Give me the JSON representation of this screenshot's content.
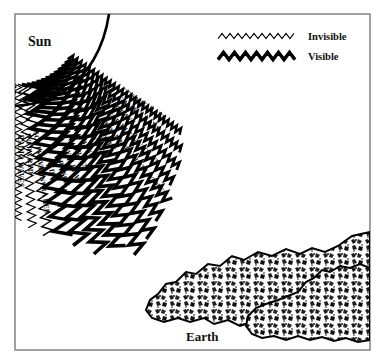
{
  "figure": {
    "sun_label": "Sun",
    "earth_label": "Earth",
    "background_color": "#ffffff",
    "ink_color": "#000000",
    "frame_color": "#8a8a8a"
  },
  "legend": {
    "items": [
      {
        "label": "Invisible",
        "style": "thin-zigzag",
        "stroke_width": 1.1
      },
      {
        "label": "Visible",
        "style": "thick-zigzag",
        "stroke_width": 3.4
      }
    ]
  },
  "chart_data": {
    "type": "diagram",
    "rays": [
      {
        "label": "COSMIC RAYS",
        "visibility": "Invisible",
        "order": 1,
        "angle_deg": 34,
        "amplitude": 3.0,
        "wavelength": 5.0,
        "stroke": 2.6
      },
      {
        "label": "GAMMA RAYS",
        "visibility": "Invisible",
        "order": 2,
        "angle_deg": 38,
        "amplitude": 3.4,
        "wavelength": 5.6,
        "stroke": 2.7
      },
      {
        "label": "X-RAYS",
        "visibility": "Invisible",
        "order": 3,
        "angle_deg": 42,
        "amplitude": 3.8,
        "wavelength": 6.2,
        "stroke": 2.8
      },
      {
        "label": "FAR ULTRAVIOLET",
        "visibility": "Invisible",
        "order": 4,
        "angle_deg": 46,
        "amplitude": 4.4,
        "wavelength": 7.0,
        "stroke": 3.0
      },
      {
        "label": "MID AND NEAR ULTRAVIOLET",
        "visibility": "Invisible",
        "order": 5,
        "angle_deg": 50,
        "amplitude": 5.0,
        "wavelength": 8.0,
        "stroke": 3.1
      },
      {
        "label": "VIOLET",
        "visibility": "Visible",
        "order": 6,
        "angle_deg": 54,
        "amplitude": 5.6,
        "wavelength": 9.0,
        "stroke": 3.3
      },
      {
        "label": "INDIGO",
        "visibility": "Visible",
        "order": 7,
        "angle_deg": 58,
        "amplitude": 6.2,
        "wavelength": 10.0,
        "stroke": 3.4
      },
      {
        "label": "BLUE",
        "visibility": "Visible",
        "order": 8,
        "angle_deg": 62,
        "amplitude": 6.8,
        "wavelength": 11.0,
        "stroke": 3.5
      },
      {
        "label": "GREEN",
        "visibility": "Visible",
        "order": 9,
        "angle_deg": 66,
        "amplitude": 7.4,
        "wavelength": 12.0,
        "stroke": 3.6
      },
      {
        "label": "YELLOW",
        "visibility": "Visible",
        "order": 10,
        "angle_deg": 70,
        "amplitude": 8.0,
        "wavelength": 13.0,
        "stroke": 3.6
      },
      {
        "label": "ORANGE",
        "visibility": "Visible",
        "order": 11,
        "angle_deg": 74,
        "amplitude": 8.6,
        "wavelength": 14.0,
        "stroke": 3.6
      },
      {
        "label": "RED",
        "visibility": "Visible",
        "order": 12,
        "angle_deg": 78,
        "amplitude": 9.2,
        "wavelength": 15.0,
        "stroke": 3.5
      },
      {
        "label": "SOFTWAVE INFRA RED",
        "visibility": "Invisible",
        "order": 13,
        "angle_deg": 82,
        "amplitude": 5.0,
        "wavelength": 9.0,
        "stroke": 1.4
      },
      {
        "label": "INFRA RED",
        "visibility": "Invisible",
        "order": 14,
        "angle_deg": 86,
        "amplitude": 4.2,
        "wavelength": 8.0,
        "stroke": 1.2
      },
      {
        "label": "RADIO WAVES",
        "visibility": "Invisible",
        "order": 15,
        "angle_deg": 90,
        "amplitude": 3.6,
        "wavelength": 7.0,
        "stroke": 1.1
      },
      {
        "label": "ELECTRIC WAVES",
        "visibility": "Invisible",
        "order": 16,
        "angle_deg": 94,
        "amplitude": 3.0,
        "wavelength": 6.0,
        "stroke": 1.0
      }
    ]
  }
}
